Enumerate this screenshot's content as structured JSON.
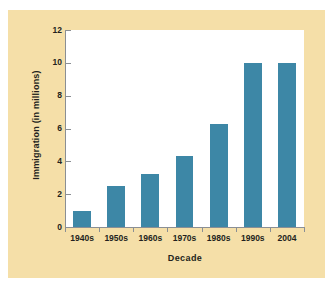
{
  "chart_data": {
    "type": "bar",
    "title": "",
    "subtitle": "",
    "xlabel": "Decade",
    "ylabel": "Immigration (in millions)",
    "categories": [
      "1940s",
      "1950s",
      "1960s",
      "1970s",
      "1980s",
      "1990s",
      "2004"
    ],
    "values": [
      1.0,
      2.5,
      3.2,
      4.3,
      6.3,
      10.0,
      10.0
    ],
    "series": [
      {
        "name": "Immigration",
        "values": [
          1.0,
          2.5,
          3.2,
          4.3,
          6.3,
          10.0,
          10.0
        ]
      }
    ],
    "ylim": [
      0,
      12
    ],
    "ytick_labels": [
      "0",
      "2",
      "4",
      "6",
      "8",
      "10",
      "12"
    ],
    "ytick_values": [
      0,
      2,
      4,
      6,
      8,
      10,
      12
    ],
    "grid": false,
    "legend": false,
    "legend_position": "none",
    "annotations": [],
    "colors": {
      "bar": "#3d87a6",
      "panel_background": "#f5dfa8",
      "plot_background": "#ffffff",
      "axis_line": "#8a8f94",
      "text": "#231f20",
      "page_background": "#ffffff"
    }
  }
}
